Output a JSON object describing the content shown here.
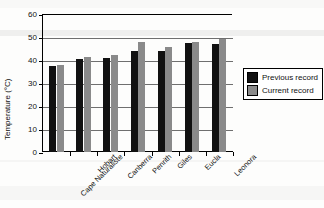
{
  "chart_data": {
    "type": "bar",
    "title": "",
    "xlabel": "",
    "ylabel": "Temperature (°C)",
    "ylim": [
      0,
      60
    ],
    "ytick_labels": [
      "60",
      "50",
      "40",
      "30",
      "20",
      "10",
      "0"
    ],
    "ytick_values": [
      60,
      50,
      40,
      30,
      20,
      10,
      0
    ],
    "grid": true,
    "legend_position": "right",
    "categories": [
      "Cape Naturaliste",
      "Hobart",
      "Canberra",
      "Penrith",
      "Giles",
      "Eucla",
      "Leonora"
    ],
    "series": [
      {
        "name": "Previous record",
        "color": "#111111",
        "values": [
          37.5,
          40.5,
          41.0,
          44.0,
          44.0,
          47.5,
          47.0
        ]
      },
      {
        "name": "Current record",
        "color": "#8a8a8a",
        "values": [
          38.0,
          41.5,
          42.0,
          48.0,
          45.5,
          48.0,
          49.0
        ]
      }
    ]
  },
  "legend": {
    "items": [
      {
        "label": "Previous record",
        "color": "#111111"
      },
      {
        "label": "Current record",
        "color": "#8a8a8a"
      }
    ]
  },
  "axes": {
    "y_title": "Temperature (°C)"
  }
}
